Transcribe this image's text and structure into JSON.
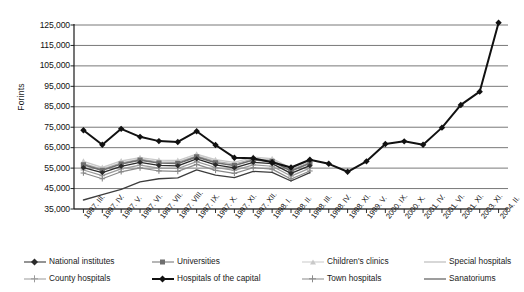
{
  "chart_data": {
    "type": "line",
    "title": "",
    "xlabel": "",
    "ylabel": "Forints",
    "ylim": [
      35000,
      125000
    ],
    "ytick_step": 10000,
    "grid": true,
    "legend_position": "bottom",
    "ytick_labels": [
      "125,000",
      "115,000",
      "105,000",
      "95,000",
      "85,000",
      "75,000",
      "65,000",
      "55,000",
      "45,000",
      "35,000"
    ],
    "categories": [
      "1997. III.",
      "1997. IV.",
      "1997. V.",
      "1997. VI.",
      "1997. VII.",
      "1997. VIII.",
      "1997. IX.",
      "1997. X.",
      "1997. XI.",
      "1997. XII.",
      "1998. I.",
      "1998. II.",
      "1998. III.",
      "1998. IV.",
      "1998. XI.",
      "1999. V.",
      "2000. IX.",
      "2000. X.",
      "2001. IV.",
      "2001. VI.",
      "2001. XI.",
      "2003. XI.",
      "2004. II."
    ],
    "series": [
      {
        "name": "National institutes",
        "color": "#2b2b2b",
        "width": 1.3,
        "marker": "diamond",
        "values": [
          55200,
          52800,
          55900,
          57800,
          56300,
          56100,
          59500,
          56600,
          55100,
          57800,
          57200,
          52400,
          56200,
          null,
          null,
          null,
          null,
          null,
          null,
          null,
          null,
          null,
          null
        ]
      },
      {
        "name": "Universities",
        "color": "#6e6e6e",
        "width": 1.6,
        "marker": "square",
        "values": [
          56600,
          53900,
          57000,
          58900,
          57500,
          57300,
          60500,
          57600,
          56300,
          59000,
          58300,
          53600,
          57400,
          null,
          null,
          null,
          null,
          null,
          null,
          null,
          null,
          null,
          null
        ]
      },
      {
        "name": "Children's clinics",
        "color": "#c9c9c9",
        "width": 1.4,
        "marker": "triangle",
        "values": [
          58300,
          55300,
          58500,
          60100,
          58900,
          58700,
          61800,
          59100,
          57800,
          60400,
          59600,
          55000,
          58800,
          null,
          null,
          null,
          null,
          null,
          null,
          null,
          null,
          null,
          null
        ]
      },
      {
        "name": "Special hospitals",
        "color": "#b0b0b0",
        "width": 1.2,
        "marker": "none",
        "values": [
          57200,
          54500,
          57600,
          59400,
          58100,
          57900,
          61000,
          58300,
          57000,
          59600,
          58900,
          54200,
          58000,
          null,
          null,
          null,
          null,
          null,
          null,
          null,
          null,
          null,
          null
        ]
      },
      {
        "name": "County hospitals",
        "color": "#9a9a9a",
        "width": 1.2,
        "marker": "plus",
        "values": [
          54100,
          51300,
          54600,
          56500,
          55000,
          54800,
          58200,
          55300,
          53900,
          56600,
          55900,
          51100,
          55000,
          null,
          null,
          null,
          null,
          null,
          null,
          null,
          null,
          null,
          null
        ]
      },
      {
        "name": "Hospitals of the capital",
        "color": "#111111",
        "width": 2.0,
        "marker": "diamond-filled",
        "values": [
          73500,
          66400,
          74200,
          70300,
          68200,
          67800,
          73000,
          66300,
          60100,
          59800,
          57900,
          55300,
          59100,
          57100,
          53200,
          58300,
          66800,
          68100,
          66400,
          74800,
          85900,
          92400,
          126100
        ]
      },
      {
        "name": "Town hospitals",
        "color": "#8a8a8a",
        "width": 1.2,
        "marker": "plus",
        "values": [
          52600,
          49800,
          53200,
          55100,
          53600,
          53400,
          56800,
          53900,
          52400,
          55200,
          54500,
          49700,
          53600,
          null,
          null,
          null,
          null,
          null,
          null,
          null,
          null,
          null,
          null
        ]
      },
      {
        "name": "Sanatoriums",
        "color": "#3d3d3d",
        "width": 1.3,
        "marker": "none",
        "values": [
          39400,
          42000,
          44600,
          48300,
          49800,
          50200,
          54100,
          51600,
          50400,
          53400,
          52900,
          48700,
          52800,
          null,
          null,
          null,
          null,
          null,
          null,
          null,
          null,
          null,
          null
        ]
      }
    ]
  },
  "legend": {
    "items": [
      {
        "label": "National institutes",
        "marker": "diamond",
        "color": "#2b2b2b",
        "width": 1.4
      },
      {
        "label": "Universities",
        "marker": "square",
        "color": "#6e6e6e",
        "width": 1.8
      },
      {
        "label": "Children's clinics",
        "marker": "triangle",
        "color": "#c9c9c9",
        "width": 1.4
      },
      {
        "label": "Special hospitals",
        "marker": "none",
        "color": "#b0b0b0",
        "width": 1.4
      },
      {
        "label": "County hospitals",
        "marker": "plus",
        "color": "#9a9a9a",
        "width": 1.3
      },
      {
        "label": "Hospitals of the capital",
        "marker": "diamond-filled",
        "color": "#111111",
        "width": 2.2
      },
      {
        "label": "Town hospitals",
        "marker": "plus",
        "color": "#8a8a8a",
        "width": 1.3
      },
      {
        "label": "Sanatoriums",
        "marker": "none",
        "color": "#3d3d3d",
        "width": 1.6
      }
    ]
  }
}
